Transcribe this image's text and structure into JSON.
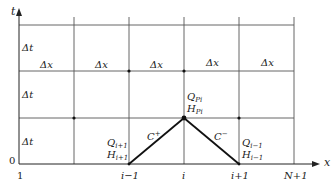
{
  "figure": {
    "type": "characteristic-grid"
  },
  "axes": {
    "t_label": "t",
    "x_label": "x",
    "origin_label": "0"
  },
  "x_ticks": [
    {
      "label": "1"
    },
    {
      "label": "i−1"
    },
    {
      "label": "i"
    },
    {
      "label": "i+1"
    },
    {
      "label": "N+1"
    }
  ],
  "row_labels": [
    {
      "label": "Δt"
    },
    {
      "label": "Δt"
    },
    {
      "label": "Δt"
    }
  ],
  "col_labels": [
    {
      "label": "Δx"
    },
    {
      "label": "Δx"
    },
    {
      "label": "Δx"
    },
    {
      "label": "Δx"
    },
    {
      "label": "Δx"
    }
  ],
  "characteristics": {
    "c_plus": {
      "label": "C",
      "sup": "+"
    },
    "c_minus": {
      "label": "C",
      "sup": "−"
    }
  },
  "points": {
    "left": {
      "q": "Q",
      "q_sub": "i+1",
      "h": "H",
      "h_sub": "i+1"
    },
    "apex": {
      "q": "Q",
      "q_sub": "Pi",
      "h": "H",
      "h_sub": "Pi"
    },
    "right": {
      "q": "Q",
      "q_sub": "i−1",
      "h": "H",
      "h_sub": "i−1"
    }
  },
  "colors": {
    "grid": "#555555",
    "axis": "#222222",
    "characteristic": "#111111"
  }
}
